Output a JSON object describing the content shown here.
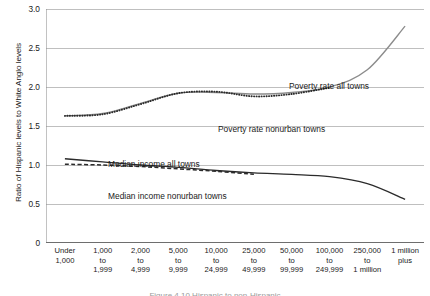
{
  "chart_data": {
    "type": "line",
    "title": "",
    "xlabel": "",
    "ylabel": "Ratio of Hispanic levels to White Anglo levels",
    "ylim": [
      0,
      3.0
    ],
    "yticks": [
      "3.0",
      "2.5",
      "2.0",
      "1.5",
      "1.0",
      "0.5",
      "0"
    ],
    "ytick_values": [
      3.0,
      2.5,
      2.0,
      1.5,
      1.0,
      0.5,
      0
    ],
    "grid": "horizontal",
    "legend_position": "inline-annotations",
    "categories": [
      "Under\n1,000",
      "1,000\nto\n1,999",
      "2,000\nto\n4,999",
      "5,000\nto\n9,999",
      "10,000\nto\n24,999",
      "25,000\nto\n49,999",
      "50,000\nto\n99,999",
      "100,000\nto\n249,999",
      "250,000\nto\n1 million",
      "1 million\nplus"
    ],
    "series": [
      {
        "name": "Poverty rate all towns",
        "style": "solid",
        "color": "#8c8c8c",
        "values": [
          1.63,
          1.66,
          1.79,
          1.92,
          1.93,
          1.91,
          1.93,
          2.0,
          2.22,
          2.78
        ]
      },
      {
        "name": "Poverty rate nonurban towns",
        "style": "dotted",
        "color": "#2b2b2b",
        "values": [
          1.63,
          1.65,
          1.78,
          1.92,
          1.94,
          1.88,
          1.91,
          1.99,
          null,
          null
        ]
      },
      {
        "name": "Median income all towns",
        "style": "solid",
        "color": "#2b2b2b",
        "values": [
          1.08,
          1.04,
          1.0,
          0.97,
          0.93,
          0.9,
          0.88,
          0.85,
          0.76,
          0.56
        ]
      },
      {
        "name": "Median income nonurban towns",
        "style": "dashed",
        "color": "#2b2b2b",
        "values": [
          1.01,
          1.0,
          0.98,
          0.95,
          0.92,
          0.88,
          null,
          null,
          null,
          null
        ]
      }
    ],
    "annotations": [
      {
        "text": "Poverty rate all towns",
        "series": "Poverty rate all towns"
      },
      {
        "text": "Poverty rate nonurban towns",
        "series": "Poverty rate nonurban towns"
      },
      {
        "text": "Median income all towns",
        "series": "Median income all towns"
      },
      {
        "text": "Median income nonurban towns",
        "series": "Median income nonurban towns"
      }
    ]
  },
  "caption": "Figure 4.10  Hispanic to non-Hispanic",
  "colors": {
    "grid": "#bfbfbf",
    "axis": "#808080",
    "series_gray": "#8c8c8c",
    "series_black": "#2b2b2b",
    "text": "#1a1a1a"
  }
}
